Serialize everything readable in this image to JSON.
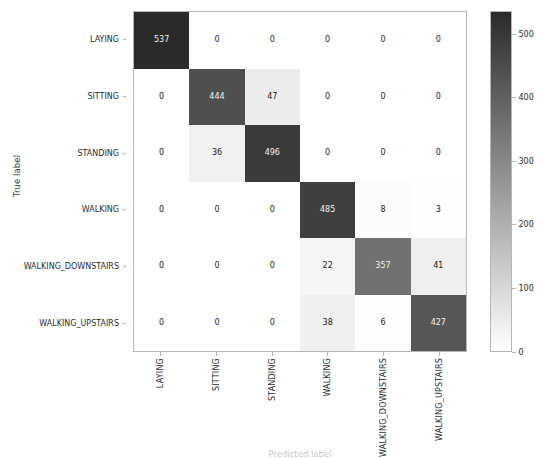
{
  "chart_data": {
    "type": "heatmap",
    "subtype": "confusion-matrix",
    "title": "",
    "xlabel": "Predicted label",
    "ylabel": "True label",
    "categories": [
      "LAYING",
      "SITTING",
      "STANDING",
      "WALKING",
      "WALKING_DOWNSTAIRS",
      "WALKING_UPSTAIRS"
    ],
    "x_tick_labels": [
      "LAYING",
      "SITTING",
      "STANDING",
      "WALKING",
      "WALKING_DOWNSTAIRS",
      "WALKING_UPSTAIRS"
    ],
    "y_tick_labels": [
      "LAYING",
      "SITTING",
      "STANDING",
      "WALKING",
      "WALKING_DOWNSTAIRS",
      "WALKING_UPSTAIRS"
    ],
    "x_tick_rotation": 90,
    "values": [
      [
        537,
        0,
        0,
        0,
        0,
        0
      ],
      [
        0,
        444,
        47,
        0,
        0,
        0
      ],
      [
        0,
        36,
        496,
        0,
        0,
        0
      ],
      [
        0,
        0,
        0,
        485,
        8,
        3
      ],
      [
        0,
        0,
        0,
        22,
        357,
        41
      ],
      [
        0,
        0,
        0,
        38,
        6,
        427
      ]
    ],
    "rows": [
      {
        "label": "LAYING",
        "values": [
          537,
          0,
          0,
          0,
          0,
          0
        ]
      },
      {
        "label": "SITTING",
        "values": [
          0,
          444,
          47,
          0,
          0,
          0
        ]
      },
      {
        "label": "STANDING",
        "values": [
          0,
          36,
          496,
          0,
          0,
          0
        ]
      },
      {
        "label": "WALKING",
        "values": [
          0,
          0,
          0,
          485,
          8,
          3
        ]
      },
      {
        "label": "WALKING_DOWNSTAIRS",
        "values": [
          0,
          0,
          0,
          22,
          357,
          41
        ]
      },
      {
        "label": "WALKING_UPSTAIRS",
        "values": [
          0,
          0,
          0,
          38,
          6,
          427
        ]
      }
    ],
    "vmin": 0,
    "vmax": 537,
    "colormap": "gray_reversed",
    "colormap_low_color": "#ffffff",
    "colormap_high_color": "#2a2a2a",
    "grid": false,
    "colorbar": {
      "position": "right",
      "ticks": [
        0,
        100,
        200,
        300,
        400,
        500
      ],
      "tick_labels": [
        "0",
        "100",
        "200",
        "300",
        "400",
        "500"
      ],
      "min": 0,
      "max": 537
    }
  },
  "axes": {
    "ylabel": "True label",
    "xlabel": "Predicted label"
  }
}
